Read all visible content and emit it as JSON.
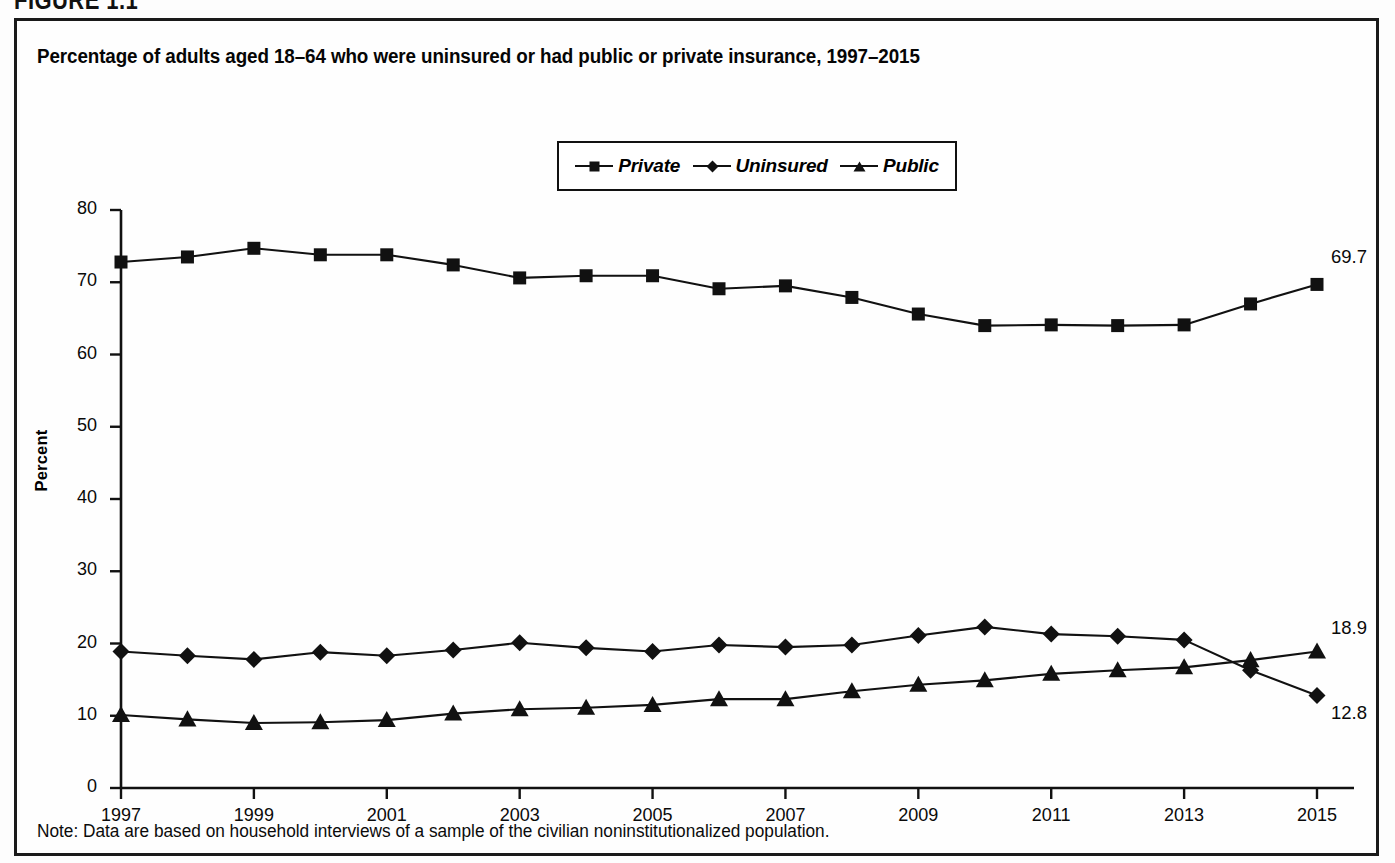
{
  "figure": {
    "caption": "FIGURE 1.1",
    "title": "Percentage of adults aged 18–64 who were uninsured or had public or private insurance, 1997–2015",
    "note": "Note: Data are based on household interviews of a sample of the civilian noninstitutionalized population."
  },
  "legend": {
    "position": "top-center",
    "entries": [
      {
        "label": "Private",
        "marker": "square-marker-icon"
      },
      {
        "label": "Uninsured",
        "marker": "diamond-marker-icon"
      },
      {
        "label": "Public",
        "marker": "triangle-marker-icon"
      }
    ]
  },
  "axes": {
    "y_title": "Percent",
    "y_ticks": [
      "0",
      "10",
      "20",
      "30",
      "40",
      "50",
      "60",
      "70",
      "80"
    ],
    "x_ticks": [
      "1997",
      "1999",
      "2001",
      "2003",
      "2005",
      "2007",
      "2009",
      "2011",
      "2013",
      "2015"
    ]
  },
  "endpoint_labels": {
    "private": "69.7",
    "public": "18.9",
    "uninsured": "12.8"
  },
  "colors": {
    "ink": "#111111",
    "frame": "#1a1a1a",
    "background": "#ffffff"
  },
  "chart_data": {
    "type": "line",
    "title": "Percentage of adults aged 18–64 who were uninsured or had public or private insurance, 1997–2015",
    "xlabel": "",
    "ylabel": "Percent",
    "ylim": [
      0,
      80
    ],
    "ytick_step": 10,
    "grid": false,
    "legend_position": "top-center",
    "x": [
      1997,
      1998,
      1999,
      2000,
      2001,
      2002,
      2003,
      2004,
      2005,
      2006,
      2007,
      2008,
      2009,
      2010,
      2011,
      2012,
      2013,
      2014,
      2015
    ],
    "x_tick_labels": [
      "1997",
      "1999",
      "2001",
      "2003",
      "2005",
      "2007",
      "2009",
      "2011",
      "2013",
      "2015"
    ],
    "series": [
      {
        "name": "Private",
        "marker": "square",
        "values": [
          72.8,
          73.5,
          74.7,
          73.8,
          73.8,
          72.4,
          70.6,
          70.9,
          70.9,
          69.1,
          69.5,
          67.9,
          65.6,
          64.0,
          64.1,
          64.0,
          64.1,
          67.0,
          69.7
        ],
        "end_label": "69.7"
      },
      {
        "name": "Uninsured",
        "marker": "diamond",
        "values": [
          18.9,
          18.3,
          17.8,
          18.8,
          18.3,
          19.1,
          20.1,
          19.4,
          18.9,
          19.8,
          19.5,
          19.8,
          21.1,
          22.3,
          21.3,
          21.0,
          20.5,
          16.3,
          12.8
        ],
        "end_label": "12.8"
      },
      {
        "name": "Public",
        "marker": "triangle",
        "values": [
          10.1,
          9.5,
          9.0,
          9.1,
          9.4,
          10.3,
          10.9,
          11.1,
          11.5,
          12.3,
          12.3,
          13.4,
          14.3,
          14.9,
          15.8,
          16.3,
          16.7,
          17.7,
          18.9
        ],
        "end_label": "18.9"
      }
    ]
  }
}
